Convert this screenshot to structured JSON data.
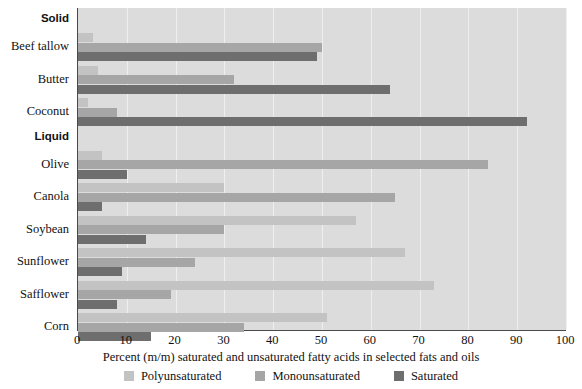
{
  "chart_data": {
    "type": "bar",
    "orientation": "horizontal",
    "title": "",
    "xlabel": "Percent (m/m) saturated and unsaturated fatty acids in selected fats and oils",
    "ylabel": "",
    "xlim": [
      0,
      100
    ],
    "xticks": [
      0,
      10,
      20,
      30,
      40,
      50,
      60,
      70,
      80,
      90,
      100
    ],
    "xtick_labels": [
      "0",
      "10",
      "20",
      "30",
      "40",
      "50",
      "60",
      "70",
      "80",
      "90",
      "100"
    ],
    "grid": true,
    "grid_axis": "x",
    "legend_position": "bottom",
    "group_headings": [
      "Solid",
      "Liquid"
    ],
    "categories": [
      "Beef tallow",
      "Butter",
      "Coconut",
      "Olive",
      "Canola",
      "Soybean",
      "Sunflower",
      "Safflower",
      "Corn"
    ],
    "series": [
      {
        "name": "Polyunsaturated",
        "color": "#c3c3c3",
        "values": [
          3,
          4,
          2,
          5,
          30,
          57,
          67,
          73,
          51
        ]
      },
      {
        "name": "Monounsaturated",
        "color": "#a6a6a6",
        "values": [
          50,
          32,
          8,
          84,
          65,
          30,
          24,
          19,
          34
        ]
      },
      {
        "name": "Saturated",
        "color": "#6e6e6e",
        "values": [
          49,
          64,
          92,
          10,
          5,
          14,
          9,
          8,
          15
        ]
      }
    ]
  },
  "axis": {
    "x_title": "Percent (m/m) saturated and unsaturated fatty acids in selected fats and oils"
  },
  "groups": [
    {
      "heading": "Solid",
      "members": [
        "Beef tallow",
        "Butter",
        "Coconut"
      ]
    },
    {
      "heading": "Liquid",
      "members": [
        "Olive",
        "Canola",
        "Soybean",
        "Sunflower",
        "Safflower",
        "Corn"
      ]
    }
  ],
  "legend": {
    "items": [
      {
        "label": "Polyunsaturated",
        "color": "#c3c3c3"
      },
      {
        "label": "Monounsaturated",
        "color": "#a6a6a6"
      },
      {
        "label": "Saturated",
        "color": "#6e6e6e"
      }
    ]
  },
  "colors": {
    "plot_background": "#dcdcdc",
    "gridline": "#efefef",
    "axis_line": "#4a4a4a",
    "polyunsaturated": "#c3c3c3",
    "monounsaturated": "#a6a6a6",
    "saturated": "#6e6e6e"
  }
}
